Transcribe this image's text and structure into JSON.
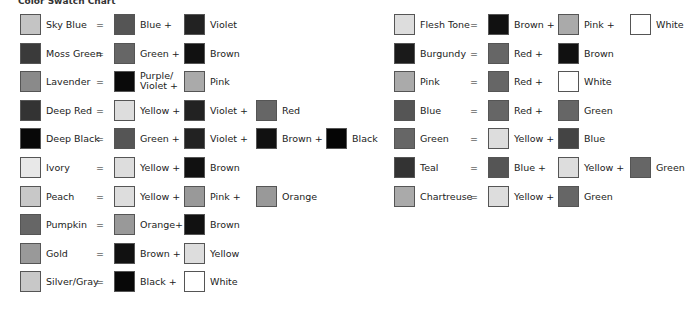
{
  "title": "Color Swatch Chart",
  "left": [
    {
      "name": "Sky Blue",
      "c": "#c4c4c4",
      "parts": [
        {
          "l": "Blue",
          "c": "#555"
        },
        {
          "l": "Violet",
          "c": "#222"
        }
      ]
    },
    {
      "name": "Moss Green",
      "c": "#3a3a3a",
      "parts": [
        {
          "l": "Green",
          "c": "#666"
        },
        {
          "l": "Brown",
          "c": "#111"
        }
      ]
    },
    {
      "name": "Lavender",
      "c": "#8a8a8a",
      "parts": [
        {
          "l": "Purple/ Violet",
          "c": "#0a0a0a",
          "two": true
        },
        {
          "l": "Pink",
          "c": "#aaa"
        }
      ]
    },
    {
      "name": "Deep Red",
      "c": "#333",
      "parts": [
        {
          "l": "Yellow",
          "c": "#ddd"
        },
        {
          "l": "Violet",
          "c": "#222"
        },
        {
          "l": "Red",
          "c": "#666"
        }
      ]
    },
    {
      "name": "Deep Black",
      "c": "#080808",
      "parts": [
        {
          "l": "Green",
          "c": "#555"
        },
        {
          "l": "Violet",
          "c": "#222"
        },
        {
          "l": "Brown",
          "c": "#111"
        },
        {
          "l": "Black",
          "c": "#050505"
        }
      ]
    },
    {
      "name": "Ivory",
      "c": "#e8e8e8",
      "parts": [
        {
          "l": "Yellow",
          "c": "#ddd"
        },
        {
          "l": "Brown",
          "c": "#111"
        }
      ]
    },
    {
      "name": "Peach",
      "c": "#c8c8c8",
      "parts": [
        {
          "l": "Yellow",
          "c": "#ddd"
        },
        {
          "l": "Pink",
          "c": "#999"
        },
        {
          "l": "Orange",
          "c": "#999"
        }
      ]
    },
    {
      "name": "Pumpkin",
      "c": "#666",
      "parts": [
        {
          "l": "Orange",
          "c": "#999",
          "plus": "+"
        },
        {
          "l": "Brown",
          "c": "#111"
        }
      ]
    },
    {
      "name": "Gold",
      "c": "#999",
      "parts": [
        {
          "l": "Brown",
          "c": "#111"
        },
        {
          "l": "Yellow",
          "c": "#ddd"
        }
      ]
    },
    {
      "name": "Silver/Gray",
      "c": "#c8c8c8",
      "parts": [
        {
          "l": "Black",
          "c": "#080808"
        },
        {
          "l": "White",
          "c": "#fff"
        }
      ]
    }
  ],
  "right": [
    {
      "name": "Flesh Tone",
      "c": "#ddd",
      "parts": [
        {
          "l": "Brown",
          "c": "#111"
        },
        {
          "l": "Pink",
          "c": "#aaa"
        },
        {
          "l": "White",
          "c": "#fff"
        }
      ]
    },
    {
      "name": "Burgundy",
      "c": "#1a1a1a",
      "parts": [
        {
          "l": "Red",
          "c": "#666"
        },
        {
          "l": "Brown",
          "c": "#111"
        }
      ]
    },
    {
      "name": "Pink",
      "c": "#aaa",
      "parts": [
        {
          "l": "Red",
          "c": "#666"
        },
        {
          "l": "White",
          "c": "#fff"
        }
      ]
    },
    {
      "name": "Blue",
      "c": "#555",
      "parts": [
        {
          "l": "Red",
          "c": "#666"
        },
        {
          "l": "Green",
          "c": "#666"
        }
      ]
    },
    {
      "name": "Green",
      "c": "#666",
      "parts": [
        {
          "l": "Yellow",
          "c": "#ddd"
        },
        {
          "l": "Blue",
          "c": "#444"
        }
      ]
    },
    {
      "name": "Teal",
      "c": "#333",
      "parts": [
        {
          "l": "Blue",
          "c": "#555"
        },
        {
          "l": "Yellow",
          "c": "#ddd"
        },
        {
          "l": "Green",
          "c": "#666"
        }
      ]
    },
    {
      "name": "Chartreuse",
      "c": "#aaa",
      "parts": [
        {
          "l": "Yellow",
          "c": "#ddd"
        },
        {
          "l": "Green",
          "c": "#666"
        }
      ]
    }
  ]
}
